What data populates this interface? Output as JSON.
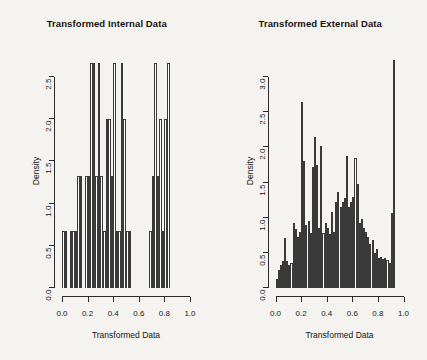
{
  "figure": {
    "background_color": "#f4f3ef",
    "bar_edge_color": "#3a3a3a",
    "bar_fill_color": "#ffffff",
    "axis_color": "#2b2b2b"
  },
  "panels": [
    {
      "id": "internal",
      "title": "Transformed Internal Data",
      "xlabel": "Transformed Data",
      "ylabel": "Density",
      "xticks": [
        "0.0",
        "0.2",
        "0.4",
        "0.6",
        "0.8",
        "1.0"
      ],
      "xtick_values": [
        0.0,
        0.2,
        0.4,
        0.6,
        0.8,
        1.0
      ],
      "yticks": [
        "0.0",
        "0.5",
        "1.0",
        "1.5",
        "2.0",
        "2.5"
      ],
      "ytick_values": [
        0.0,
        0.5,
        1.0,
        1.5,
        2.0,
        2.5
      ]
    },
    {
      "id": "external",
      "title": "Transformed External Data",
      "xlabel": "Transformed Data",
      "ylabel": "Density",
      "xticks": [
        "0.0",
        "0.2",
        "0.4",
        "0.6",
        "0.8",
        "1.0"
      ],
      "xtick_values": [
        0.0,
        0.2,
        0.4,
        0.6,
        0.8,
        1.0
      ],
      "yticks": [
        "0.0",
        "0.5",
        "1.0",
        "1.5",
        "2.0",
        "2.5",
        "3.0"
      ],
      "ytick_values": [
        0.0,
        0.5,
        1.0,
        1.5,
        2.0,
        2.5,
        3.0
      ]
    }
  ],
  "chart_data": [
    {
      "type": "bar",
      "subtype": "histogram",
      "title": "Transformed Internal Data",
      "xlabel": "Transformed Data",
      "ylabel": "Density",
      "xlim": [
        0.0,
        1.0
      ],
      "ylim": [
        0.0,
        2.75
      ],
      "grid": false,
      "legend": null,
      "bin_width": 0.02,
      "bin_edges": [
        0.0,
        0.02,
        0.04,
        0.06,
        0.08,
        0.1,
        0.12,
        0.14,
        0.16,
        0.18,
        0.2,
        0.22,
        0.24,
        0.26,
        0.28,
        0.3,
        0.32,
        0.34,
        0.36,
        0.38,
        0.4,
        0.42,
        0.44,
        0.46,
        0.48,
        0.5,
        0.52,
        0.54,
        0.56,
        0.58,
        0.6,
        0.62,
        0.64,
        0.66,
        0.68,
        0.7,
        0.72,
        0.74,
        0.76,
        0.78,
        0.8,
        0.82,
        0.84,
        0.86,
        0.88,
        0.9,
        0.92,
        0.94,
        0.96,
        0.98,
        1.0
      ],
      "values": [
        0.67,
        0.67,
        0.0,
        0.67,
        0.67,
        0.67,
        1.33,
        1.33,
        0.0,
        1.33,
        1.33,
        2.67,
        2.67,
        1.33,
        2.67,
        1.33,
        0.67,
        2.0,
        2.0,
        1.33,
        2.67,
        0.67,
        0.67,
        2.67,
        2.0,
        0.67,
        0.67,
        0.0,
        0.0,
        0.0,
        0.0,
        0.0,
        0.0,
        0.0,
        0.67,
        1.33,
        2.67,
        1.33,
        2.0,
        0.67,
        2.0,
        2.67,
        0.0,
        0.0,
        0.0,
        0.0,
        0.0,
        0.0,
        0.0,
        0.0
      ]
    },
    {
      "type": "bar",
      "subtype": "histogram",
      "title": "Transformed External Data",
      "xlabel": "Transformed Data",
      "ylabel": "Density",
      "xlim": [
        0.0,
        1.0
      ],
      "ylim": [
        0.0,
        3.3
      ],
      "grid": false,
      "legend": null,
      "bin_width": 0.0167,
      "bin_edges": [
        0.0,
        0.017,
        0.033,
        0.05,
        0.067,
        0.083,
        0.1,
        0.117,
        0.133,
        0.15,
        0.167,
        0.183,
        0.2,
        0.217,
        0.233,
        0.25,
        0.267,
        0.283,
        0.3,
        0.317,
        0.333,
        0.35,
        0.367,
        0.383,
        0.4,
        0.417,
        0.433,
        0.45,
        0.467,
        0.483,
        0.5,
        0.517,
        0.533,
        0.55,
        0.567,
        0.583,
        0.6,
        0.617,
        0.633,
        0.65,
        0.667,
        0.683,
        0.7,
        0.717,
        0.733,
        0.75,
        0.767,
        0.783,
        0.8,
        0.817,
        0.833,
        0.85,
        0.867,
        0.883,
        0.9,
        0.917,
        0.933,
        0.95,
        0.967,
        0.983,
        1.0
      ],
      "values": [
        0.13,
        0.26,
        0.33,
        0.38,
        0.71,
        0.38,
        0.33,
        0.36,
        0.93,
        0.84,
        0.72,
        0.8,
        2.65,
        1.8,
        0.9,
        0.95,
        0.78,
        1.72,
        2.15,
        1.75,
        0.86,
        2.02,
        0.78,
        0.92,
        0.85,
        0.77,
        1.08,
        0.8,
        1.22,
        1.36,
        1.15,
        1.22,
        1.28,
        1.88,
        1.15,
        1.23,
        1.3,
        1.85,
        1.48,
        0.92,
        0.98,
        0.86,
        0.79,
        0.72,
        0.63,
        0.68,
        0.5,
        0.55,
        0.42,
        0.44,
        0.41,
        0.42,
        0.4,
        0.36,
        1.06,
        3.25
      ]
    }
  ]
}
